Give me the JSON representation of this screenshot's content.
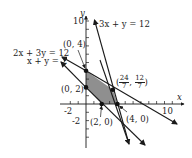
{
  "figure": {
    "axes": {
      "x_label": "x",
      "y_label": "y",
      "x_tick_labels": [
        "-2",
        "10"
      ],
      "y_tick_labels": [
        "10",
        "-2"
      ],
      "x_range": [
        -3,
        12
      ],
      "y_range": [
        -5,
        11
      ]
    },
    "lines": [
      {
        "equation": "3x + y = 12"
      },
      {
        "equation": "2x + 3y = 12"
      },
      {
        "equation": "x + y = 2"
      }
    ],
    "vertices": [
      {
        "label": "(0, 4)",
        "x": 0,
        "y": 4
      },
      {
        "label": "(0, 2)",
        "x": 0,
        "y": 2
      },
      {
        "label": "(2, 0)",
        "x": 2,
        "y": 0
      },
      {
        "label": "(4, 0)",
        "x": 4,
        "y": 0
      },
      {
        "label_open": "(",
        "frac1_num": "24",
        "frac1_den": "7",
        "sep": ", ",
        "frac2_num": "12",
        "frac2_den": "7",
        "label_close": ")",
        "x": 3.4286,
        "y": 1.7143
      }
    ],
    "feasible_region": {
      "fill": "#8f8f8f",
      "polygon": [
        [
          0,
          2
        ],
        [
          0,
          4
        ],
        [
          3.4286,
          1.7143
        ],
        [
          4,
          0
        ],
        [
          2,
          0
        ]
      ]
    },
    "colors": {
      "line": "#1a1a1a",
      "shade": "#8f8f8f"
    }
  }
}
